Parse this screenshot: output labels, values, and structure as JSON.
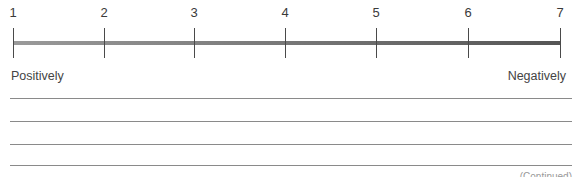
{
  "scale": {
    "ticks": [
      {
        "label": "1",
        "x": 13
      },
      {
        "label": "2",
        "x": 104
      },
      {
        "label": "3",
        "x": 194
      },
      {
        "label": "4",
        "x": 285
      },
      {
        "label": "5",
        "x": 376
      },
      {
        "label": "6",
        "x": 468
      },
      {
        "label": "7",
        "x": 560
      }
    ],
    "left_anchor": "Positively",
    "right_anchor": "Negatively",
    "bar_gradient": [
      "#9a9a9a",
      "#555555"
    ]
  },
  "writing_lines": {
    "count": 4,
    "y": [
      98,
      121,
      144,
      165
    ]
  },
  "footer_fragment": "(Continued)"
}
